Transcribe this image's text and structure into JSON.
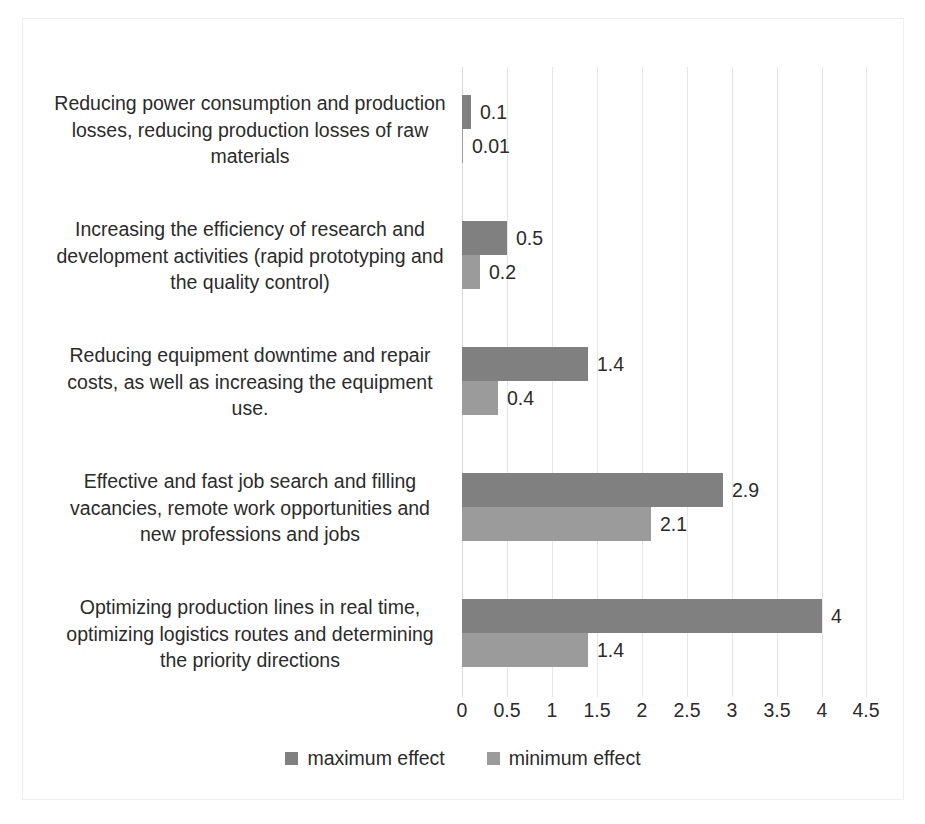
{
  "chart_data": {
    "type": "bar",
    "orientation": "horizontal",
    "title": "",
    "xlabel": "",
    "ylabel": "",
    "xlim": [
      0,
      4.5
    ],
    "xticks": [
      "0",
      "0.5",
      "1",
      "1.5",
      "2",
      "2.5",
      "3",
      "3.5",
      "4",
      "4.5"
    ],
    "grid": true,
    "legend_position": "bottom",
    "categories": [
      "Reducing power consumption and production losses, reducing production losses of raw materials",
      "Increasing the efficiency of research and development activities (rapid prototyping and the quality control)",
      "Reducing equipment downtime and repair costs, as well as increasing the equipment use.",
      "Effective and fast job search and filling vacancies, remote work opportunities and new professions and jobs",
      "Optimizing production lines in real time, optimizing logistics routes and determining the priority directions"
    ],
    "series": [
      {
        "name": "maximum effect",
        "color": "#808080",
        "values": [
          0.1,
          0.5,
          1.4,
          2.9,
          4
        ],
        "labels": [
          "0.1",
          "0.5",
          "1.4",
          "2.9",
          "4"
        ]
      },
      {
        "name": "minimum effect",
        "color": "#9b9b9b",
        "values": [
          0.01,
          0.2,
          0.4,
          2.1,
          1.4
        ],
        "labels": [
          "0.01",
          "0.2",
          "0.4",
          "2.1",
          "1.4"
        ]
      }
    ]
  }
}
